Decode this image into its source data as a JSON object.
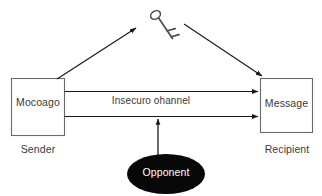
{
  "diagram": {
    "colors": {
      "background": "#ffffff",
      "stroke": "#555555",
      "arrow": "#1a1a1a",
      "text": "#3a3a3a",
      "opponent_fill": "#080808",
      "opponent_text": "#ffffff"
    },
    "nodes": {
      "sender_box": {
        "label": "Mocoago",
        "caption": "Sender"
      },
      "recipient_box": {
        "label": "Message",
        "caption": "Recipient"
      },
      "opponent": {
        "label": "Opponent"
      },
      "key": {
        "icon": "key-icon"
      }
    },
    "edges": {
      "channel_label": "Insecuro ohannel",
      "sender_to_key": "arrow-up-right",
      "key_to_recipient": "arrow-down-right",
      "channel_top": "arrow-right",
      "channel_bottom": "arrow-right",
      "opponent_to_channel": "arrow-up"
    }
  }
}
